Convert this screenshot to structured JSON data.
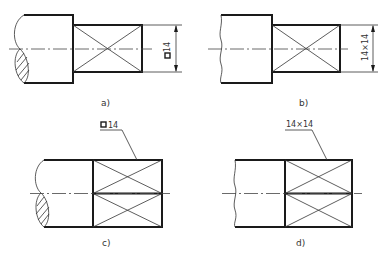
{
  "figure": {
    "panels": [
      {
        "id": "a",
        "caption": "a)",
        "dimension_label": "14",
        "dimension_symbol": "square",
        "dimension_style": "vertical-dimension-line"
      },
      {
        "id": "b",
        "caption": "b)",
        "dimension_label": "14×14",
        "dimension_style": "vertical-dimension-line"
      },
      {
        "id": "c",
        "caption": "c)",
        "dimension_label": "14",
        "dimension_symbol": "square",
        "dimension_style": "leader-line"
      },
      {
        "id": "d",
        "caption": "d)",
        "dimension_label": "14×14",
        "dimension_style": "leader-line"
      }
    ]
  },
  "colors": {
    "line": "#1a1a1a",
    "background": "#ffffff"
  }
}
